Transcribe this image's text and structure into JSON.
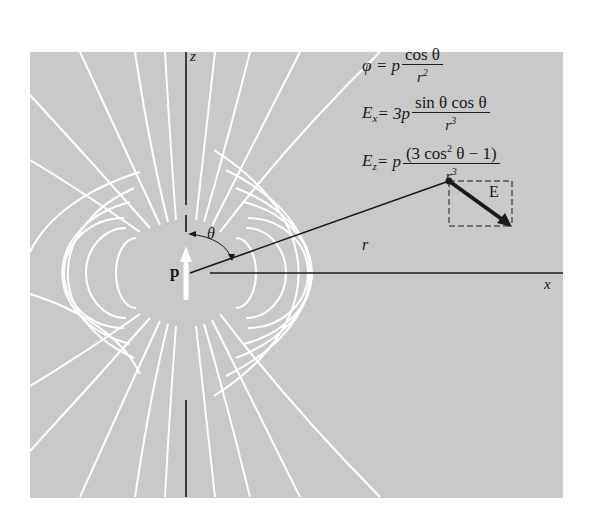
{
  "figure": {
    "background_color": "#c9c9c9",
    "field_line_color": "#ffffff",
    "ink_color": "#1a1a1a"
  },
  "axes": {
    "z_label": "z",
    "x_label": "x"
  },
  "labels": {
    "dipole": "p",
    "angle": "θ",
    "radius": "r",
    "field_vector": "E"
  },
  "equations": {
    "phi": {
      "lhs": "φ = p",
      "numerator": "cos θ",
      "denominator": "r",
      "denominator_exp": "2"
    },
    "ex": {
      "lhs": "E",
      "lhs_sub": "x",
      "rhs_prefix": " = 3p",
      "numerator": "sin θ cos θ",
      "denominator": "r",
      "denominator_exp": "3"
    },
    "ez": {
      "lhs": "E",
      "lhs_sub": "z",
      "rhs_prefix": " = p",
      "numerator_a": "(3 cos",
      "numerator_exp": "2",
      "numerator_b": " θ − 1)",
      "denominator": "r",
      "denominator_exp": "3"
    }
  }
}
